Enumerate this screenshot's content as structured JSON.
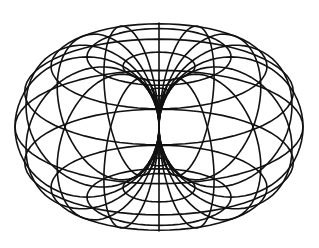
{
  "figure": {
    "caption": "",
    "background": "#ffffff",
    "stroke_color": "#111111",
    "stroke_width": 1.6
  },
  "torus": {
    "major_radius": 1.0,
    "minor_radius": 1.0,
    "meridians": 16,
    "parallels": 12,
    "center_px": [
      159,
      127
    ],
    "scale_px": 72,
    "tilt_deg": 22,
    "samples": 64
  }
}
